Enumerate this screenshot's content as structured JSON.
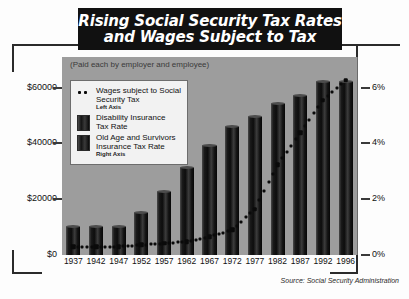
{
  "title": {
    "line1": "Rising Social Security Tax Rates",
    "line2": "and Wages Subject to Tax"
  },
  "subtitle": "(Paid each by employer and employee)",
  "source": "Source: Social Security Administration",
  "legend": {
    "items": [
      {
        "mark": "dots",
        "line1": "Wages subject to Social",
        "line2": "Security Tax",
        "axis": "Left Axis"
      },
      {
        "mark": "swatch",
        "line1": "Disability Insurance",
        "line2": "Tax Rate",
        "axis": ""
      },
      {
        "mark": "swatch",
        "line1": "Old Age and Survivors",
        "line2": "Insurance Tax Rate",
        "axis": "Right Axis"
      }
    ]
  },
  "chart_data": {
    "type": "bar",
    "title": "Rising Social Security Tax Rates and Wages Subject to Tax",
    "subtitle": "(Paid each by employer and employee)",
    "xlabel": "",
    "ylabel": "",
    "grid": false,
    "legend_position": "inside-top-left",
    "categories": [
      "1937",
      "1942",
      "1947",
      "1952",
      "1957",
      "1962",
      "1967",
      "1972",
      "1977",
      "1982",
      "1987",
      "1992",
      "1996"
    ],
    "series": [
      {
        "name": "Old Age and Survivors Insurance Tax Rate",
        "axis": "right",
        "unit": "%",
        "type": "bar-stacked",
        "values": [
          1.0,
          1.0,
          1.0,
          1.5,
          2.0,
          2.875,
          3.55,
          4.05,
          4.375,
          4.575,
          5.2,
          5.6,
          5.6
        ]
      },
      {
        "name": "Disability Insurance Tax Rate",
        "axis": "right",
        "unit": "%",
        "type": "bar-stacked",
        "values": [
          0.0,
          0.0,
          0.0,
          0.0,
          0.25,
          0.25,
          0.35,
          0.55,
          0.575,
          0.825,
          0.5,
          0.6,
          0.6
        ]
      },
      {
        "name": "Wages subject to Social Security Tax",
        "axis": "left",
        "unit": "$",
        "type": "line-dotted",
        "values": [
          3000,
          3000,
          3000,
          3600,
          4200,
          4800,
          6600,
          9000,
          16500,
          32400,
          43800,
          55500,
          62700
        ]
      }
    ],
    "left_axis": {
      "label": "",
      "ticks": [
        "$0",
        "$20000",
        "$40000",
        "$60000"
      ],
      "tick_values": [
        0,
        20000,
        40000,
        60000
      ],
      "ylim": [
        0,
        66000
      ]
    },
    "right_axis": {
      "label": "",
      "ticks": [
        "0%",
        "2%",
        "4%",
        "6%"
      ],
      "tick_values": [
        0,
        2,
        4,
        6
      ],
      "ylim": [
        0,
        6.6
      ]
    }
  }
}
